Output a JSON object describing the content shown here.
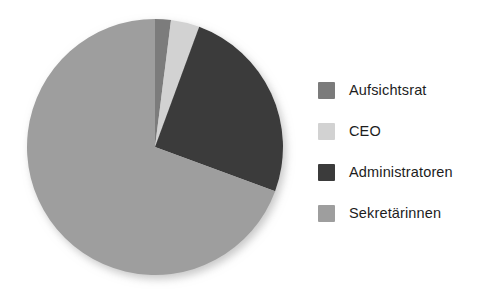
{
  "chart_data": {
    "type": "pie",
    "title": "",
    "subtitle": "",
    "xlabel": "",
    "ylabel": "",
    "grid": false,
    "legend_position": "right",
    "start_angle_deg": 0,
    "direction": "clockwise",
    "categories": [
      "Aufsichtsrat",
      "CEO",
      "Administratoren",
      "Sekretärinnen"
    ],
    "values": [
      2,
      3.6,
      25,
      69.4
    ],
    "units": "percent",
    "colors": [
      "#7b7b7b",
      "#d2d2d2",
      "#3b3b3b",
      "#9e9e9e"
    ],
    "slices": [
      {
        "label": "Aufsichtsrat",
        "value": 2,
        "color": "#7b7b7b",
        "start_deg": 0,
        "end_deg": 7.2
      },
      {
        "label": "CEO",
        "value": 3.6,
        "color": "#d2d2d2",
        "start_deg": 7.2,
        "end_deg": 20.2
      },
      {
        "label": "Administratoren",
        "value": 25,
        "color": "#3b3b3b",
        "start_deg": 20.2,
        "end_deg": 110.2
      },
      {
        "label": "Sekretärinnen",
        "value": 69.4,
        "color": "#9e9e9e",
        "start_deg": 110.2,
        "end_deg": 360
      }
    ],
    "data_labels_visible": false,
    "annotations": []
  },
  "legend": {
    "items": [
      {
        "label": "Aufsichtsrat",
        "color": "#7b7b7b"
      },
      {
        "label": "CEO",
        "color": "#d2d2d2"
      },
      {
        "label": "Administratoren",
        "color": "#3b3b3b"
      },
      {
        "label": "Sekretärinnen",
        "color": "#9e9e9e"
      }
    ]
  },
  "canvas": {
    "background": "#ffffff",
    "pie_center_x": 155,
    "pie_center_y": 147,
    "pie_radius": 128
  }
}
